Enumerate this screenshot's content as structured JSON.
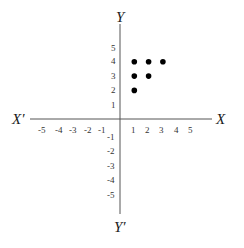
{
  "chart_data": {
    "type": "scatter",
    "title": "",
    "xlabel": "X",
    "xlabel_neg": "X′",
    "ylabel": "Y",
    "ylabel_neg": "Y′",
    "xlim": [
      -5,
      5
    ],
    "ylim": [
      -5,
      5
    ],
    "grid": false,
    "x_ticks": [
      -5,
      -4,
      -3,
      -2,
      -1,
      1,
      2,
      3,
      4,
      5
    ],
    "y_ticks": [
      5,
      4,
      3,
      2,
      1,
      -1,
      -2,
      -3,
      -4,
      -5
    ],
    "points": [
      {
        "x": 1,
        "y": 2
      },
      {
        "x": 1,
        "y": 3
      },
      {
        "x": 2,
        "y": 3
      },
      {
        "x": 1,
        "y": 4
      },
      {
        "x": 2,
        "y": 4
      },
      {
        "x": 3,
        "y": 4
      }
    ],
    "point_color": "#000000"
  },
  "labels": {
    "x_pos": "X",
    "x_neg": "X′",
    "y_pos": "Y",
    "y_neg": "Y′",
    "xt": [
      "-5",
      "-4",
      "-3",
      "-2",
      "-1",
      "1",
      "2",
      "3",
      "4",
      "5"
    ],
    "yt": [
      "5",
      "4",
      "3",
      "2",
      "1",
      "-1",
      "-2",
      "-3",
      "-4",
      "-5"
    ]
  }
}
